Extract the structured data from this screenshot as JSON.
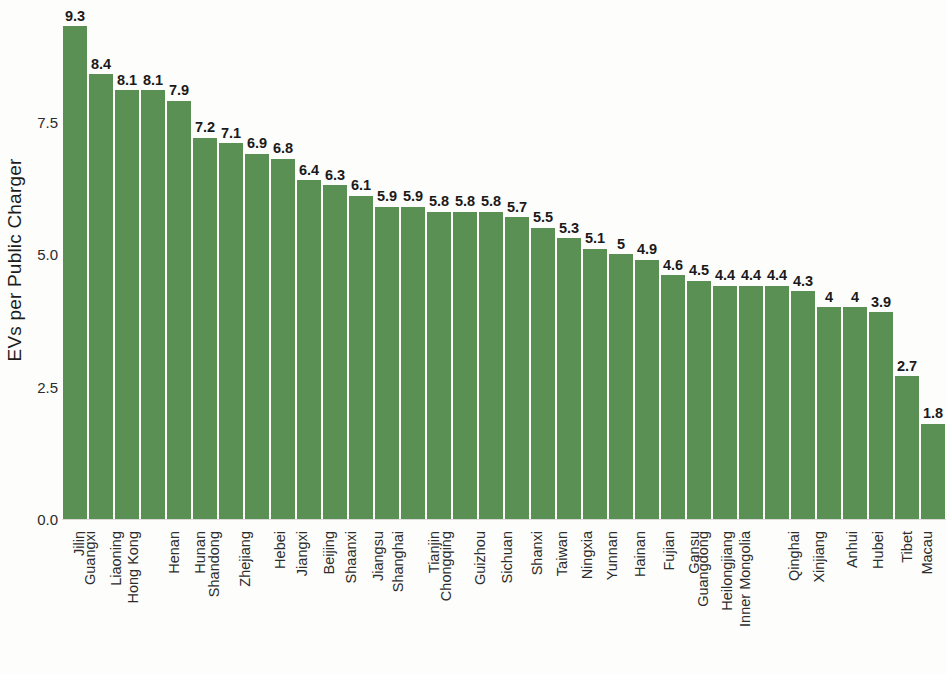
{
  "chart_data": {
    "type": "bar",
    "title": "",
    "xlabel": "",
    "ylabel": "EVs per Public Charger",
    "ylim": [
      0,
      9.8
    ],
    "yticks": [
      "0.0",
      "2.5",
      "5.0",
      "7.5"
    ],
    "ytick_values": [
      0.0,
      2.5,
      5.0,
      7.5
    ],
    "grid": false,
    "legend": null,
    "bar_color": "#5b9055",
    "background_color": "#fdfdfb",
    "categories": [
      "Jilin",
      "Guangxi",
      "Liaoning",
      "Hong Kong",
      "Henan",
      "Hunan",
      "Shandong",
      "Zhejiang",
      "Hebei",
      "Jiangxi",
      "Beijing",
      "Shaanxi",
      "Jiangsu",
      "Shanghai",
      "Tianjin",
      "Chongqing",
      "Guizhou",
      "Sichuan",
      "Shanxi",
      "Taiwan",
      "Ningxia",
      "Yunnan",
      "Hainan",
      "Fujian",
      "Gansu",
      "Guangdong",
      "Heilongjiang",
      "Inner Mongolia",
      "Qinghai",
      "Xinjiang",
      "Anhui",
      "Hubei",
      "Tibet",
      "Macau"
    ],
    "values": [
      9.3,
      8.4,
      8.1,
      8.1,
      7.9,
      7.2,
      7.1,
      6.9,
      6.8,
      6.4,
      6.3,
      6.1,
      5.9,
      5.9,
      5.8,
      5.8,
      5.8,
      5.7,
      5.5,
      5.3,
      5.1,
      5,
      4.9,
      4.6,
      4.5,
      4.4,
      4.4,
      4.4,
      4.3,
      4,
      4,
      3.9,
      2.7,
      1.8
    ],
    "value_labels": [
      "9.3",
      "8.4",
      "8.1",
      "8.1",
      "7.9",
      "7.2",
      "7.1",
      "6.9",
      "6.8",
      "6.4",
      "6.3",
      "6.1",
      "5.9",
      "5.9",
      "5.8",
      "5.8",
      "5.8",
      "5.7",
      "5.5",
      "5.3",
      "5.1",
      "5",
      "4.9",
      "4.6",
      "4.5",
      "4.4",
      "4.4",
      "4.4",
      "4.3",
      "4",
      "4",
      "3.9",
      "2.7",
      "1.8"
    ]
  }
}
